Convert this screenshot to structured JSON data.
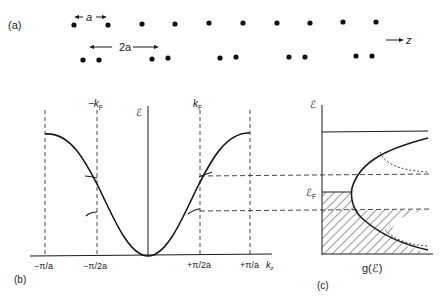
{
  "panels": {
    "a": {
      "label": "(a)",
      "spacing_label_a": "a",
      "spacing_label_2a": "2a",
      "axis_label": "z",
      "top_row_atoms": 10,
      "bottom_row_pairs": 5
    },
    "b": {
      "label": "(b)",
      "y_axis_label": "ℰ",
      "x_axis_label": "k",
      "x_axis_sub": "z",
      "kf_neg_label": "−k",
      "kf_pos_label": "k",
      "kf_sub": "F",
      "ticks": [
        "−π/a",
        "−π/2a",
        "+π/2a",
        "+π/a"
      ]
    },
    "c": {
      "label": "(c)",
      "y_axis_label": "ℰ",
      "ef_label": "ℰ",
      "ef_sub": "F",
      "x_axis_label": "g(ℰ)"
    }
  },
  "colors": {
    "ink": "#1a1a1a",
    "background": "#ffffff"
  }
}
